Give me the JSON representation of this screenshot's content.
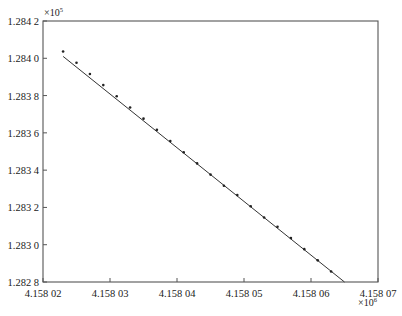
{
  "chart_data": {
    "type": "scatter",
    "title": "",
    "xlabel": "",
    "ylabel": "",
    "x_multiplier": "×10",
    "x_multiplier_exp": "6",
    "y_multiplier": "×10",
    "y_multiplier_exp": "5",
    "xlim": [
      4.15802,
      4.15807
    ],
    "ylim": [
      1.2828,
      1.2842
    ],
    "x_ticks": [
      4.15802,
      4.15803,
      4.15804,
      4.15805,
      4.15806,
      4.15807
    ],
    "x_tick_labels": [
      "4.158 02",
      "4.158 03",
      "4.158 04",
      "4.158 05",
      "4.158 06",
      "4.158 07"
    ],
    "y_ticks": [
      1.2842,
      1.284,
      1.2838,
      1.2836,
      1.2834,
      1.2832,
      1.283,
      1.2828
    ],
    "y_tick_labels": [
      "1.284 2",
      "1.284 0",
      "1.283 8",
      "1.283 6",
      "1.283 4",
      "1.283 2",
      "1.283 0",
      "1.282 8"
    ],
    "grid": false,
    "legend": null,
    "series": [
      {
        "name": "observed points",
        "kind": "scatter",
        "x": [
          4.158023,
          4.158024,
          4.158025,
          4.158026,
          4.158027,
          4.158028,
          4.158029,
          4.15803,
          4.158031,
          4.158032,
          4.158033,
          4.158034,
          4.158035,
          4.158036,
          4.158037,
          4.158038,
          4.158039,
          4.15804,
          4.158041,
          4.158042,
          4.158043,
          4.158044,
          4.158045,
          4.158046,
          4.158047,
          4.158048,
          4.158049,
          4.15805,
          4.158051,
          4.158052,
          4.158053,
          4.158054,
          4.158055,
          4.158056,
          4.158057,
          4.158058,
          4.158059,
          4.15806,
          4.158061,
          4.158062,
          4.158063
        ],
        "y": [
          1.28402,
          1.28399,
          1.28396,
          1.28393,
          1.2839,
          1.28387,
          1.28384,
          1.28381,
          1.28378,
          1.28375,
          1.28372,
          1.28369,
          1.28366,
          1.28363,
          1.2836,
          1.28357,
          1.28354,
          1.28351,
          1.28348,
          1.28345,
          1.28342,
          1.28339,
          1.28336,
          1.28333,
          1.2833,
          1.28327,
          1.28325,
          1.28322,
          1.28319,
          1.28316,
          1.28313,
          1.28311,
          1.28308,
          1.28305,
          1.28302,
          1.28299,
          1.28296,
          1.28293,
          1.2829,
          1.28287,
          1.28284
        ]
      },
      {
        "name": "fitted line",
        "kind": "line",
        "x": [
          4.158023,
          4.158065
        ],
        "y": [
          1.28401,
          1.2828
        ]
      }
    ]
  }
}
